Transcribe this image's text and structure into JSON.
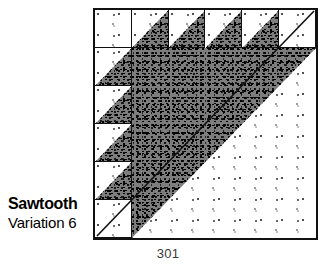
{
  "page": {
    "page_number": "301",
    "background_color": "#ffffff"
  },
  "caption": {
    "block_name": "Sawtooth",
    "variation_label": "Variation 6"
  },
  "quilt_block": {
    "name": "Sawtooth Variation 6",
    "grid": "6x6",
    "rows": 6,
    "columns": 6,
    "cell_size_px": 37,
    "border_color": "#111111",
    "dark_patch_color": "#4d4d4d",
    "light_patch_color": "#ffffff",
    "patch_fills": [
      "light-stipple",
      "dark-stipple"
    ],
    "top_row": [
      {
        "index": 0,
        "type": "plain-light",
        "fill": "light-stipple"
      },
      {
        "index": 1,
        "type": "half-square-triangle",
        "dark_corner": "lower-right"
      },
      {
        "index": 2,
        "type": "half-square-triangle",
        "dark_corner": "lower-right"
      },
      {
        "index": 3,
        "type": "half-square-triangle",
        "dark_corner": "lower-right"
      },
      {
        "index": 4,
        "type": "half-square-triangle",
        "dark_corner": "lower-right"
      },
      {
        "index": 5,
        "type": "plain-light-diagonal",
        "fill": "light-stipple"
      }
    ],
    "left_column": [
      {
        "index": 0,
        "type": "plain-light",
        "fill": "light-stipple"
      },
      {
        "index": 1,
        "type": "half-square-triangle",
        "dark_corner": "lower-right"
      },
      {
        "index": 2,
        "type": "half-square-triangle",
        "dark_corner": "lower-right"
      },
      {
        "index": 3,
        "type": "half-square-triangle",
        "dark_corner": "lower-right"
      },
      {
        "index": 4,
        "type": "half-square-triangle",
        "dark_corner": "lower-right"
      },
      {
        "index": 5,
        "type": "plain-light-diagonal",
        "fill": "light-stipple"
      }
    ],
    "center_field": {
      "type": "large-half-square-triangle",
      "spans_rows": "1-5",
      "spans_columns": "1-5",
      "dark_half": "upper-left",
      "light_half": "lower-right",
      "diagonal": "top-right-to-bottom-left"
    }
  }
}
